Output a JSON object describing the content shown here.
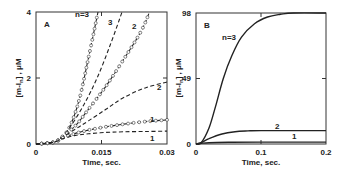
{
  "chart_data": [
    {
      "type": "line",
      "panel": "A",
      "xlabel": "Time, sec.",
      "ylabel": "[m-I_n] , μM",
      "xlim": [
        0,
        0.03
      ],
      "ylim": [
        0,
        4
      ],
      "xticks": [
        "0",
        "0.015",
        "0.03"
      ],
      "yticks": [
        "0",
        "2",
        "4"
      ],
      "grid": false,
      "legend": "inline curve labels",
      "series": [
        {
          "name": "n=3 (circles, simulation)",
          "style": "dashed+circles",
          "x": [
            0,
            0.004,
            0.006,
            0.008,
            0.01,
            0.012,
            0.0142
          ],
          "y": [
            0,
            0.05,
            0.2,
            0.6,
            1.4,
            2.6,
            4.0
          ]
        },
        {
          "name": "3 (dashed)",
          "style": "dashed",
          "x": [
            0,
            0.004,
            0.006,
            0.008,
            0.011,
            0.014,
            0.017,
            0.0197
          ],
          "y": [
            0,
            0.05,
            0.22,
            0.55,
            1.2,
            2.0,
            3.0,
            4.0
          ]
        },
        {
          "name": "2 (circles)",
          "style": "dashed+circles",
          "x": [
            0,
            0.004,
            0.006,
            0.009,
            0.012,
            0.016,
            0.02,
            0.024,
            0.026
          ],
          "y": [
            0,
            0.05,
            0.22,
            0.55,
            1.05,
            1.75,
            2.55,
            3.4,
            4.0
          ]
        },
        {
          "name": "2 (dashed)",
          "style": "dashed",
          "x": [
            0,
            0.004,
            0.006,
            0.009,
            0.012,
            0.016,
            0.02,
            0.025,
            0.03
          ],
          "y": [
            0,
            0.05,
            0.2,
            0.45,
            0.7,
            1.05,
            1.4,
            1.7,
            1.88
          ]
        },
        {
          "name": "1 (circles)",
          "style": "dashed+circles",
          "x": [
            0,
            0.004,
            0.006,
            0.009,
            0.012,
            0.016,
            0.02,
            0.025,
            0.03
          ],
          "y": [
            0,
            0.05,
            0.18,
            0.32,
            0.42,
            0.52,
            0.6,
            0.68,
            0.73
          ]
        },
        {
          "name": "1 (dashed)",
          "style": "dashed",
          "x": [
            0,
            0.004,
            0.006,
            0.009,
            0.012,
            0.016,
            0.02,
            0.025,
            0.03
          ],
          "y": [
            0,
            0.05,
            0.16,
            0.26,
            0.31,
            0.35,
            0.37,
            0.38,
            0.39
          ]
        }
      ],
      "annotations": [
        "A",
        "n=3",
        "3",
        "2",
        "2",
        "1",
        "1"
      ]
    },
    {
      "type": "line",
      "panel": "B",
      "xlabel": "Time, sec.",
      "ylabel": "[m-I_n] , μM",
      "xlim": [
        0,
        0.2
      ],
      "ylim": [
        0,
        98
      ],
      "xticks": [
        "0",
        "0.1",
        "0.2"
      ],
      "yticks": [
        "0",
        "49",
        "98"
      ],
      "grid": false,
      "legend": "inline curve labels",
      "series": [
        {
          "name": "n=3",
          "style": "solid",
          "x": [
            0,
            0.008,
            0.02,
            0.03,
            0.042,
            0.055,
            0.07,
            0.09,
            0.11,
            0.13,
            0.15,
            0.2
          ],
          "y": [
            0,
            1,
            12,
            28,
            49,
            66,
            80,
            90,
            95,
            97,
            98,
            98
          ]
        },
        {
          "name": "2",
          "style": "solid",
          "x": [
            0,
            0.008,
            0.02,
            0.04,
            0.06,
            0.08,
            0.1,
            0.2
          ],
          "y": [
            0,
            1,
            4,
            7.5,
            9.2,
            9.8,
            10,
            10
          ]
        },
        {
          "name": "1",
          "style": "solid",
          "x": [
            0,
            0.008,
            0.02,
            0.05,
            0.1,
            0.2
          ],
          "y": [
            0,
            0.5,
            1.0,
            1.3,
            1.4,
            1.4
          ]
        }
      ],
      "annotations": [
        "B",
        "n=3",
        "2",
        "1"
      ]
    }
  ],
  "labels": {
    "panelA": {
      "letter": "A",
      "xlabel": "Time, sec.",
      "ylabel": "[m-I",
      "ylabel_sub": "n",
      "ylabel_end": "] , μM",
      "xticks": [
        "0",
        "0.015",
        "0.03"
      ],
      "yticks": [
        "0",
        "2",
        "4"
      ],
      "curve_labels": [
        "n=3",
        "3",
        "2",
        "2",
        "1",
        "1"
      ]
    },
    "panelB": {
      "letter": "B",
      "xlabel": "Time, sec.",
      "ylabel": "[m-I",
      "ylabel_sub": "n",
      "ylabel_end": "] , μM",
      "xticks": [
        "0",
        "0.1",
        "0.2"
      ],
      "yticks": [
        "0",
        "49",
        "98"
      ],
      "curve_labels": [
        "n=3",
        "2",
        "1"
      ]
    }
  }
}
